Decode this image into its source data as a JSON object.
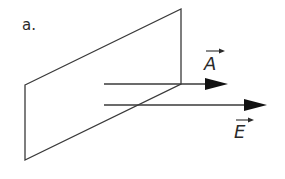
{
  "diagram": {
    "part_label": "a.",
    "vector_a_label": "A",
    "vector_e_label": "E",
    "colors": {
      "stroke": "#3a3a3a",
      "arrowhead": "#111111",
      "background": "#ffffff"
    }
  }
}
